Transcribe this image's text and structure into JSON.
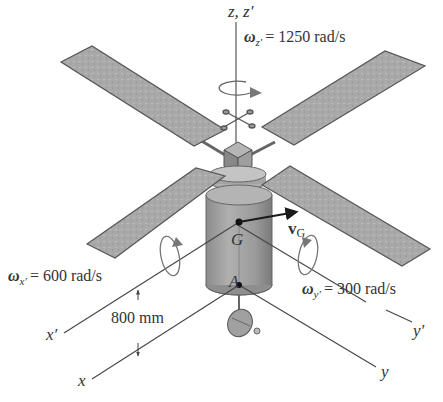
{
  "figure": {
    "type": "3D isometric satellite diagram",
    "colors": {
      "background": "#ffffff",
      "panel_fill": "#a8a8a8",
      "panel_stroke": "#555555",
      "body_fill": "#9a9a9a",
      "axis_line": "#444444",
      "text": "#333333",
      "velocity_arrow": "#1a1a1a"
    }
  },
  "axes": {
    "z_label": "z, z′",
    "x_prime_label": "x′",
    "x_label": "x",
    "y_prime_label": "y′",
    "y_label": "y"
  },
  "points": {
    "G": "G",
    "A": "A"
  },
  "vectors": {
    "velocity_symbol": "v",
    "velocity_subscript": "G"
  },
  "angular_velocities": {
    "z": {
      "symbol": "ω",
      "subscript": "z′",
      "value": "= 1250 rad/s"
    },
    "x": {
      "symbol": "ω",
      "subscript": "x′",
      "value": "= 600 rad/s"
    },
    "y": {
      "symbol": "ω",
      "subscript": "y′",
      "value": "= 300 rad/s"
    }
  },
  "dimensions": {
    "offset": "800 mm"
  }
}
